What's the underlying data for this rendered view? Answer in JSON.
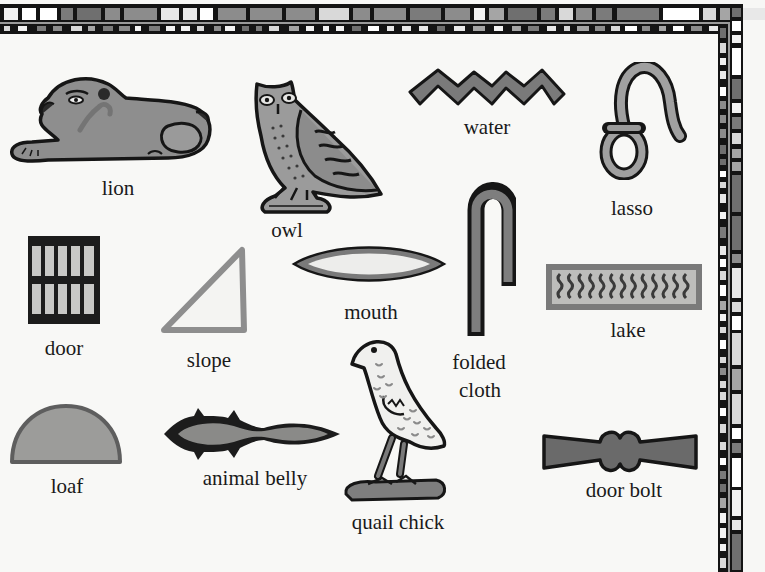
{
  "colors": {
    "background": "#f8f8f6",
    "outline": "#141414",
    "fill_mid": "#8a8a8a",
    "fill_light": "#bdbdbd",
    "fill_pale": "#e6e6e4"
  },
  "glyphs": [
    {
      "id": "lion",
      "label": "lion",
      "icon": "lion-icon"
    },
    {
      "id": "owl",
      "label": "owl",
      "icon": "owl-icon"
    },
    {
      "id": "water",
      "label": "water",
      "icon": "water-zigzag-icon"
    },
    {
      "id": "lasso",
      "label": "lasso",
      "icon": "lasso-rope-icon"
    },
    {
      "id": "door",
      "label": "door",
      "icon": "door-icon"
    },
    {
      "id": "slope",
      "label": "slope",
      "icon": "slope-triangle-icon"
    },
    {
      "id": "mouth",
      "label": "mouth",
      "icon": "mouth-icon"
    },
    {
      "id": "folded_cloth",
      "label": "folded\ncloth",
      "label_lines": [
        "folded",
        "cloth"
      ],
      "icon": "folded-cloth-icon"
    },
    {
      "id": "lake",
      "label": "lake",
      "icon": "lake-icon"
    },
    {
      "id": "loaf",
      "label": "loaf",
      "icon": "loaf-icon"
    },
    {
      "id": "animal_belly",
      "label": "animal belly",
      "icon": "animal-belly-icon"
    },
    {
      "id": "quail_chick",
      "label": "quail chick",
      "icon": "quail-chick-icon"
    },
    {
      "id": "door_bolt",
      "label": "door bolt",
      "icon": "door-bolt-icon"
    }
  ]
}
